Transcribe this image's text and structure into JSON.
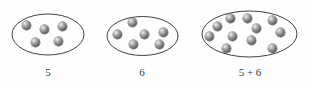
{
  "figure": {
    "background_color": "#fdfdfd",
    "dot_color": "#6e6e6e",
    "outline_color": "#2b2b2b"
  },
  "groups": [
    {
      "name": "group-one",
      "caption": "5",
      "count": 5,
      "oval": {
        "cx": 48,
        "cy": 34.5,
        "rx": 36,
        "ry": 20.5
      },
      "dots": [
        {
          "x": 22,
          "y": 21
        },
        {
          "x": 40,
          "y": 25
        },
        {
          "x": 58,
          "y": 22
        },
        {
          "x": 31,
          "y": 38
        },
        {
          "x": 54,
          "y": 37
        }
      ]
    },
    {
      "name": "group-two",
      "caption": "6",
      "count": 6,
      "oval": {
        "cx": 142.5,
        "cy": 36,
        "rx": 35.5,
        "ry": 19.5
      },
      "dots": [
        {
          "x": 128,
          "y": 18
        },
        {
          "x": 113,
          "y": 30
        },
        {
          "x": 140,
          "y": 30
        },
        {
          "x": 159,
          "y": 28
        },
        {
          "x": 129,
          "y": 40
        },
        {
          "x": 155,
          "y": 40
        }
      ]
    },
    {
      "name": "group-three",
      "caption": "5 + 6",
      "count": 11,
      "oval": {
        "cx": 249.5,
        "cy": 34,
        "rx": 47.5,
        "ry": 23
      },
      "dots": [
        {
          "x": 226,
          "y": 14
        },
        {
          "x": 243,
          "y": 14
        },
        {
          "x": 268,
          "y": 16
        },
        {
          "x": 213,
          "y": 22
        },
        {
          "x": 252,
          "y": 24
        },
        {
          "x": 276,
          "y": 28
        },
        {
          "x": 205,
          "y": 32
        },
        {
          "x": 228,
          "y": 32
        },
        {
          "x": 247,
          "y": 36
        },
        {
          "x": 222,
          "y": 44
        },
        {
          "x": 268,
          "y": 44
        }
      ]
    }
  ],
  "captions": [
    {
      "text": "5",
      "x": 48,
      "y": 66
    },
    {
      "text": "6",
      "x": 142,
      "y": 66
    },
    {
      "text": "5 + 6",
      "x": 250,
      "y": 66
    }
  ]
}
